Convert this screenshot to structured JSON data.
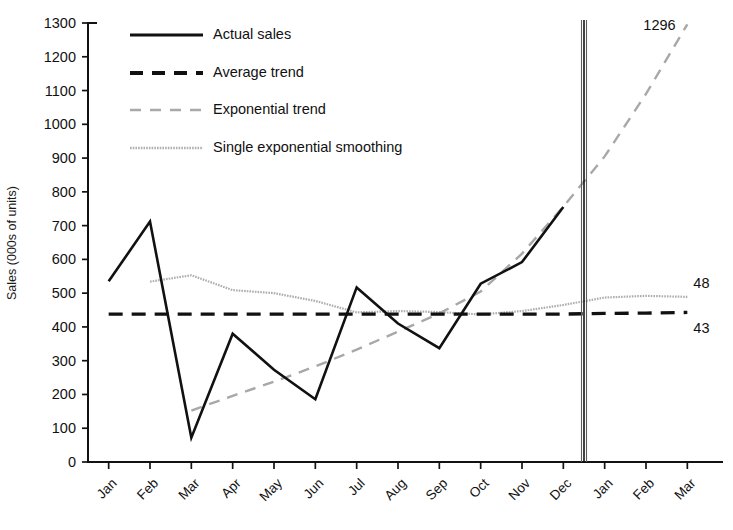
{
  "chart_data": {
    "type": "line",
    "title": "",
    "xlabel": "",
    "ylabel": "Sales (000s of units)",
    "ylim": [
      0,
      1300
    ],
    "ytick_step": 100,
    "grid": false,
    "legend_position": "top-left",
    "categories": [
      "Jan",
      "Feb",
      "Mar",
      "Apr",
      "May",
      "Jun",
      "Jul",
      "Aug",
      "Sep",
      "Oct",
      "Nov",
      "Dec",
      "Jan",
      "Feb",
      "Mar"
    ],
    "ytick_labels": [
      "0",
      "100",
      "200",
      "300",
      "400",
      "500",
      "600",
      "700",
      "800",
      "900",
      "1000",
      "1100",
      "1200",
      "1300"
    ],
    "forecast_divider_after": "Dec",
    "series": [
      {
        "name": "Actual sales",
        "style": "solid-black",
        "values": [
          535,
          712,
          72,
          380,
          273,
          186,
          517,
          410,
          337,
          528,
          592,
          755,
          null,
          null,
          null
        ]
      },
      {
        "name": "Average trend",
        "style": "dashed-black",
        "values": [
          438,
          438,
          438,
          438,
          438,
          438,
          438,
          438,
          438,
          438,
          438,
          438,
          440,
          441,
          443
        ],
        "end_label": "43"
      },
      {
        "name": "Exponential trend",
        "style": "dashed-grey",
        "values": [
          null,
          null,
          152,
          196,
          238,
          283,
          333,
          386,
          440,
          505,
          617,
          756,
          905,
          1090,
          1296
        ],
        "end_label": "1296"
      },
      {
        "name": "Single exponential smoothing",
        "style": "dotted-grey",
        "values": [
          null,
          534,
          553,
          509,
          500,
          477,
          443,
          447,
          444,
          437,
          447,
          465,
          487,
          492,
          489
        ],
        "end_label": "48"
      }
    ],
    "annotations": [
      {
        "text": "1296",
        "series": "Exponential trend",
        "at": "Mar",
        "position": "right"
      },
      {
        "text": "48",
        "series": "Single exponential smoothing",
        "at": "Mar",
        "position": "right"
      },
      {
        "text": "43",
        "series": "Average trend",
        "at": "Mar",
        "position": "right"
      }
    ],
    "legend": [
      {
        "label": "Actual sales",
        "style": "solid-black"
      },
      {
        "label": "Average trend",
        "style": "dashed-black"
      },
      {
        "label": "Exponential trend",
        "style": "dashed-grey"
      },
      {
        "label": "Single exponential smoothing",
        "style": "dotted-grey"
      }
    ]
  }
}
